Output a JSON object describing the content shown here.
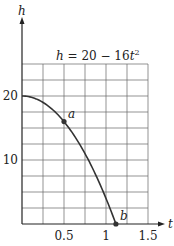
{
  "chart_data": {
    "type": "line",
    "title": "",
    "equation": "h = 20 − 16t²",
    "equation_parts": {
      "lhs": "h",
      "mid": " = 20 − 16",
      "var": "t",
      "exp": "2"
    },
    "xlabel": "t",
    "ylabel": "h",
    "xlim": [
      0,
      1.5
    ],
    "ylim": [
      0,
      25
    ],
    "x_ticks": [
      0.5,
      1,
      1.5
    ],
    "x_tick_labels": [
      "0.5",
      "1",
      "1.5"
    ],
    "y_ticks": [
      10,
      20
    ],
    "y_tick_labels": [
      "10",
      "20"
    ],
    "grid": true,
    "grid_step_x": 0.25,
    "grid_step_y": 2.5,
    "series": [
      {
        "name": "h = 20 - 16t^2",
        "x": [
          0,
          0.1,
          0.2,
          0.3,
          0.4,
          0.5,
          0.6,
          0.7,
          0.8,
          0.9,
          1.0,
          1.118
        ],
        "values": [
          20,
          19.84,
          19.36,
          18.56,
          17.44,
          16,
          14.24,
          12.16,
          9.76,
          7.04,
          4,
          0
        ]
      }
    ],
    "annotations": [
      {
        "label": "a",
        "x": 0.5,
        "y": 16
      },
      {
        "label": "b",
        "x": 1.118,
        "y": 0
      }
    ]
  },
  "colors": {
    "curve": "#333333",
    "grid": "#555555",
    "axis": "#222222"
  }
}
